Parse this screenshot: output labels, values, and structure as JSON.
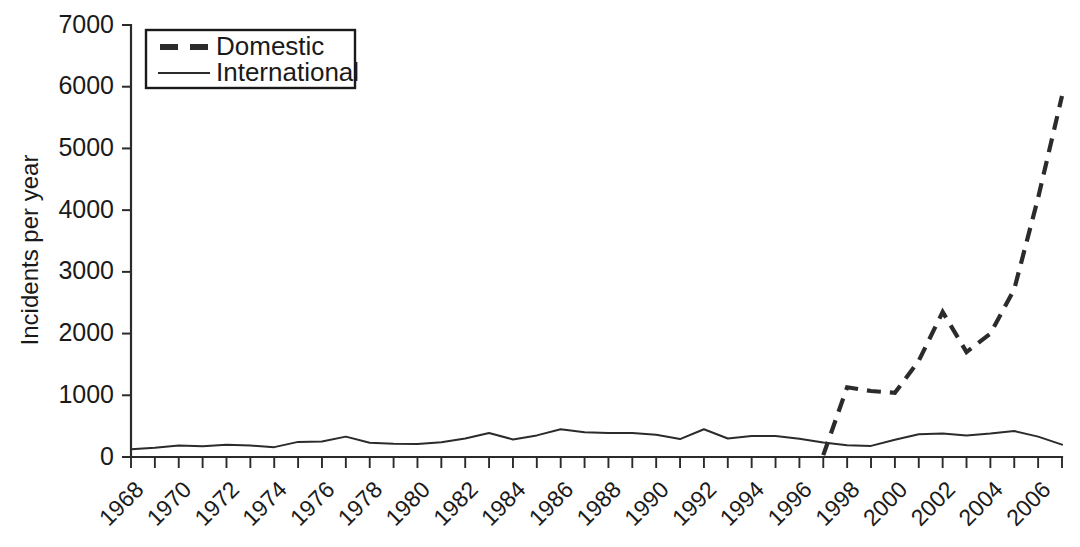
{
  "chart_data": {
    "type": "line",
    "title": "",
    "xlabel": "",
    "ylabel": "Incidents per year",
    "xlim": [
      1968,
      2007
    ],
    "ylim": [
      0,
      7000
    ],
    "yticks": [
      0,
      1000,
      2000,
      3000,
      4000,
      5000,
      6000,
      7000
    ],
    "ytick_labels": [
      "0",
      "1000",
      "2000",
      "3000",
      "4000",
      "5000",
      "6000",
      "7000"
    ],
    "xticks_all_years": [
      1968,
      1969,
      1970,
      1971,
      1972,
      1973,
      1974,
      1975,
      1976,
      1977,
      1978,
      1979,
      1980,
      1981,
      1982,
      1983,
      1984,
      1985,
      1986,
      1987,
      1988,
      1989,
      1990,
      1991,
      1992,
      1993,
      1994,
      1995,
      1996,
      1997,
      1998,
      1999,
      2000,
      2001,
      2002,
      2003,
      2004,
      2005,
      2006,
      2007
    ],
    "xtick_labels": [
      "1968",
      "1970",
      "1972",
      "1974",
      "1976",
      "1978",
      "1980",
      "1982",
      "1984",
      "1986",
      "1988",
      "1990",
      "1992",
      "1994",
      "1996",
      "1998",
      "2000",
      "2002",
      "2004",
      "2006"
    ],
    "xtick_label_years": [
      1968,
      1970,
      1972,
      1974,
      1976,
      1978,
      1980,
      1982,
      1984,
      1986,
      1988,
      1990,
      1992,
      1994,
      1996,
      1998,
      2000,
      2002,
      2004,
      2006
    ],
    "grid": false,
    "legend_position": "top-left",
    "series": [
      {
        "name": "Domestic",
        "style": "dashed",
        "color": "#2b2b2b",
        "x": [
          1997,
          1998,
          1999,
          2000,
          2001,
          2002,
          2003,
          2004,
          2005,
          2006,
          2007
        ],
        "values": [
          30,
          1130,
          1070,
          1040,
          1560,
          2350,
          1700,
          2000,
          2720,
          4200,
          5850
        ]
      },
      {
        "name": "International",
        "style": "solid",
        "color": "#2b2b2b",
        "x": [
          1968,
          1969,
          1970,
          1971,
          1972,
          1973,
          1974,
          1975,
          1976,
          1977,
          1978,
          1979,
          1980,
          1981,
          1982,
          1983,
          1984,
          1985,
          1986,
          1987,
          1988,
          1989,
          1990,
          1991,
          1992,
          1993,
          1994,
          1995,
          1996,
          1997,
          1998,
          1999,
          2000,
          2001,
          2002,
          2003,
          2004,
          2005,
          2006,
          2007
        ],
        "values": [
          125,
          150,
          185,
          175,
          200,
          185,
          160,
          245,
          250,
          330,
          230,
          215,
          210,
          240,
          300,
          390,
          285,
          350,
          450,
          400,
          390,
          390,
          360,
          290,
          450,
          300,
          340,
          340,
          295,
          235,
          190,
          180,
          280,
          370,
          380,
          350,
          380,
          420,
          330,
          200
        ]
      }
    ]
  },
  "legend": {
    "items": [
      {
        "label": "Domestic",
        "style": "dashed"
      },
      {
        "label": "International",
        "style": "solid"
      }
    ]
  },
  "axis": {
    "y_title": "Incidents per year"
  }
}
